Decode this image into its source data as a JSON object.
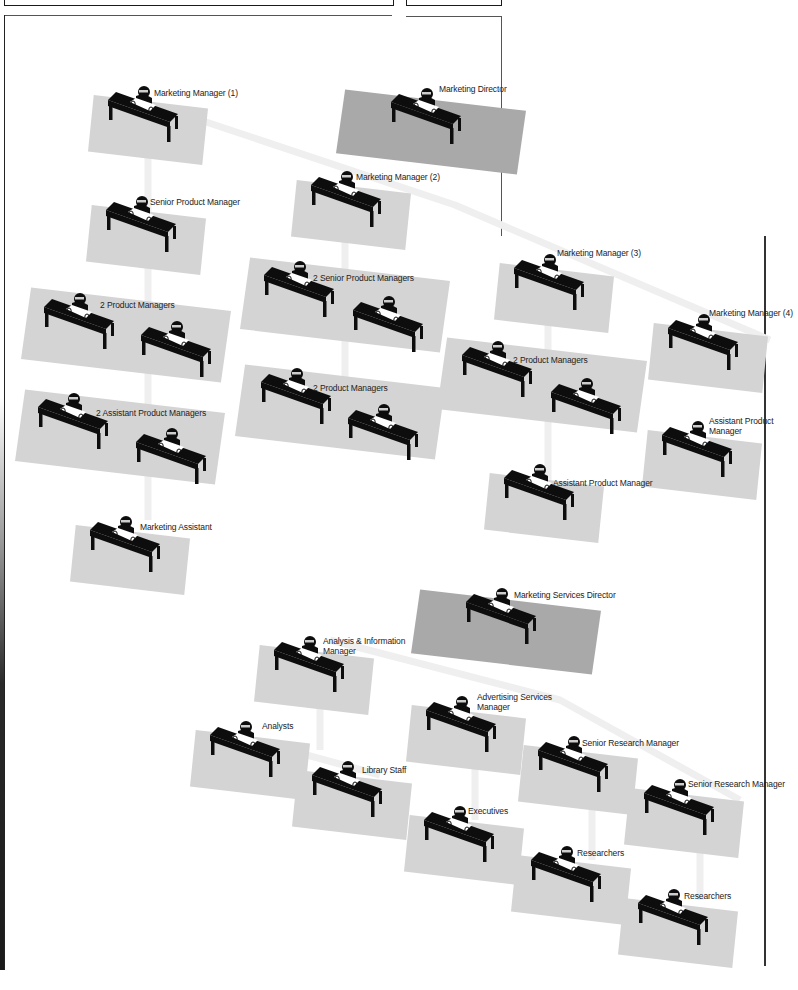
{
  "diagram": {
    "type": "isometric-office-org-chart",
    "colors": {
      "floor": "#d4d4d4",
      "floor_director": "#a9a9a9",
      "connector": "#efefef",
      "desk": "#0d0d0d",
      "paper": "#ffffff",
      "frame": "#1a1a1a"
    },
    "desks": [
      {
        "id": "mm1",
        "label": "Marketing Manager (1)",
        "x": 142,
        "y": 90,
        "floor": "normal",
        "fw": 120,
        "fh": 70
      },
      {
        "id": "md",
        "label": "Marketing Director",
        "x": 425,
        "y": 92,
        "floor": "director",
        "fw": 190,
        "fh": 85
      },
      {
        "id": "spm",
        "label": "Senior Product Manager",
        "x": 140,
        "y": 200,
        "floor": "normal",
        "fw": 120,
        "fh": 70
      },
      {
        "id": "mm2",
        "label": "Marketing Manager (2)",
        "x": 345,
        "y": 175,
        "floor": "normal",
        "fw": 120,
        "fh": 70
      },
      {
        "id": "pm-a1",
        "label": "2 Product Managers",
        "x": 78,
        "y": 297,
        "floor": "none"
      },
      {
        "id": "pm-a2",
        "label": "",
        "x": 175,
        "y": 325,
        "floor": "none"
      },
      {
        "id": "ssp-1",
        "label": "2 Senior Product Managers",
        "x": 298,
        "y": 265,
        "floor": "none"
      },
      {
        "id": "ssp-2",
        "label": "",
        "x": 387,
        "y": 300,
        "floor": "none"
      },
      {
        "id": "mm3",
        "label": "Marketing Manager (3)",
        "x": 548,
        "y": 258,
        "floor": "normal",
        "fw": 120,
        "fh": 70
      },
      {
        "id": "mm4",
        "label": "Marketing Manager (4)",
        "x": 702,
        "y": 318,
        "floor": "normal",
        "fw": 120,
        "fh": 70
      },
      {
        "id": "apm-a1",
        "label": "2 Assistant Product Managers",
        "x": 72,
        "y": 397,
        "floor": "none"
      },
      {
        "id": "apm-a2",
        "label": "",
        "x": 170,
        "y": 432,
        "floor": "none"
      },
      {
        "id": "pm-b1",
        "label": "2 Product Managers",
        "x": 295,
        "y": 372,
        "floor": "none"
      },
      {
        "id": "pm-b2",
        "label": "",
        "x": 382,
        "y": 408,
        "floor": "none"
      },
      {
        "id": "pm-c1",
        "label": "2 Product Managers",
        "x": 496,
        "y": 345,
        "floor": "none"
      },
      {
        "id": "pm-c2",
        "label": "",
        "x": 585,
        "y": 382,
        "floor": "none"
      },
      {
        "id": "apm4",
        "label": "Assistant Product Manager",
        "x": 696,
        "y": 425,
        "floor": "normal",
        "fw": 120,
        "fh": 70
      },
      {
        "id": "apm3",
        "label": "Assistant Product Manager",
        "x": 538,
        "y": 468,
        "floor": "normal",
        "fw": 120,
        "fh": 70
      },
      {
        "id": "ma",
        "label": "Marketing Assistant",
        "x": 124,
        "y": 520,
        "floor": "normal",
        "fw": 120,
        "fh": 70
      },
      {
        "id": "msd",
        "label": "Marketing Services Director",
        "x": 500,
        "y": 592,
        "floor": "director",
        "fw": 190,
        "fh": 85
      },
      {
        "id": "aim",
        "label": "Analysis & Information Manager",
        "x": 308,
        "y": 640,
        "floor": "normal",
        "fw": 120,
        "fh": 70
      },
      {
        "id": "asm",
        "label": "Advertising Services Manager",
        "x": 460,
        "y": 700,
        "floor": "normal",
        "fw": 120,
        "fh": 70
      },
      {
        "id": "an",
        "label": "Analysts",
        "x": 244,
        "y": 725,
        "floor": "normal",
        "fw": 120,
        "fh": 70
      },
      {
        "id": "srm1",
        "label": "Senior Research Manager",
        "x": 572,
        "y": 740,
        "floor": "normal",
        "fw": 120,
        "fh": 70
      },
      {
        "id": "ls",
        "label": "Library Staff",
        "x": 346,
        "y": 765,
        "floor": "normal",
        "fw": 120,
        "fh": 70
      },
      {
        "id": "srm2",
        "label": "Senior Research Manager",
        "x": 678,
        "y": 783,
        "floor": "normal",
        "fw": 120,
        "fh": 70
      },
      {
        "id": "ex",
        "label": "Executives",
        "x": 458,
        "y": 810,
        "floor": "normal",
        "fw": 120,
        "fh": 70
      },
      {
        "id": "rs1",
        "label": "Researchers",
        "x": 565,
        "y": 850,
        "floor": "normal",
        "fw": 120,
        "fh": 70
      },
      {
        "id": "rs2",
        "label": "Researchers",
        "x": 672,
        "y": 893,
        "floor": "normal",
        "fw": 120,
        "fh": 70
      }
    ],
    "pair_floors": [
      {
        "id": "pf-pm-a",
        "x": 126,
        "y": 335,
        "w": 210,
        "h": 95
      },
      {
        "id": "pf-ssp",
        "x": 345,
        "y": 305,
        "w": 210,
        "h": 95
      },
      {
        "id": "pf-apm-a",
        "x": 120,
        "y": 437,
        "w": 210,
        "h": 95
      },
      {
        "id": "pf-pm-b",
        "x": 340,
        "y": 412,
        "w": 210,
        "h": 95
      },
      {
        "id": "pf-pm-c",
        "x": 542,
        "y": 385,
        "w": 210,
        "h": 95
      }
    ],
    "connectors": [
      [
        [
          185,
          115
        ],
        [
          455,
          205
        ],
        [
          770,
          340
        ]
      ],
      [
        [
          148,
          148
        ],
        [
          148,
          520
        ]
      ],
      [
        [
          345,
          215
        ],
        [
          345,
          440
        ]
      ],
      [
        [
          548,
          300
        ],
        [
          548,
          490
        ]
      ],
      [
        [
          330,
          640
        ],
        [
          560,
          700
        ],
        [
          740,
          800
        ]
      ],
      [
        [
          270,
          745
        ],
        [
          380,
          775
        ]
      ],
      [
        [
          320,
          670
        ],
        [
          320,
          750
        ]
      ],
      [
        [
          475,
          735
        ],
        [
          475,
          820
        ]
      ],
      [
        [
          592,
          775
        ],
        [
          592,
          860
        ]
      ],
      [
        [
          700,
          815
        ],
        [
          700,
          900
        ]
      ]
    ],
    "labels": [
      {
        "id": "mm1",
        "text": "Marketing Manager (1)",
        "x": 154,
        "y": 88
      },
      {
        "id": "md",
        "text": "Marketing Director",
        "x": 439,
        "y": 84
      },
      {
        "id": "mm2",
        "text": "Marketing Manager (2)",
        "x": 356,
        "y": 172
      },
      {
        "id": "spm",
        "text": "Senior Product Manager",
        "x": 150,
        "y": 197
      },
      {
        "id": "mm3",
        "text": "Marketing Manager (3)",
        "x": 557,
        "y": 248
      },
      {
        "id": "ssp",
        "text": "2 Senior Product Managers",
        "x": 313,
        "y": 273
      },
      {
        "id": "pm-a",
        "text": "2 Product Managers",
        "x": 100,
        "y": 300
      },
      {
        "id": "mm4",
        "text": "Marketing Manager (4)",
        "x": 709,
        "y": 308
      },
      {
        "id": "pm-c",
        "text": "2 Product Managers",
        "x": 513,
        "y": 355
      },
      {
        "id": "pm-b",
        "text": "2 Product Managers",
        "x": 313,
        "y": 383
      },
      {
        "id": "apm-a",
        "text": "2 Assistant Product Managers",
        "x": 96,
        "y": 408
      },
      {
        "id": "apm4",
        "text": "Assistant Product",
        "x": 709,
        "y": 416
      },
      {
        "id": "apm4b",
        "text": "Manager",
        "x": 709,
        "y": 426
      },
      {
        "id": "apm3",
        "text": "Assistant Product Manager",
        "x": 553,
        "y": 478
      },
      {
        "id": "ma",
        "text": "Marketing Assistant",
        "x": 140,
        "y": 522
      },
      {
        "id": "msd",
        "text": "Marketing Services Director",
        "x": 514,
        "y": 590
      },
      {
        "id": "aim",
        "text": "Analysis & Information",
        "x": 323,
        "y": 636
      },
      {
        "id": "aimb",
        "text": "Manager",
        "x": 323,
        "y": 646
      },
      {
        "id": "asm",
        "text": "Advertising Services",
        "x": 477,
        "y": 692
      },
      {
        "id": "asmb",
        "text": "Manager",
        "x": 477,
        "y": 702
      },
      {
        "id": "an",
        "text": "Analysts",
        "x": 262,
        "y": 721
      },
      {
        "id": "srm1",
        "text": "Senior Research Manager",
        "x": 582,
        "y": 738
      },
      {
        "id": "ls",
        "text": "Library Staff",
        "x": 362,
        "y": 765
      },
      {
        "id": "srm2",
        "text": "Senior Research Manager",
        "x": 688,
        "y": 779
      },
      {
        "id": "ex",
        "text": "Executives",
        "x": 468,
        "y": 806
      },
      {
        "id": "rs1",
        "text": "Researchers",
        "x": 577,
        "y": 848
      },
      {
        "id": "rs2",
        "text": "Researchers",
        "x": 684,
        "y": 891
      }
    ]
  }
}
